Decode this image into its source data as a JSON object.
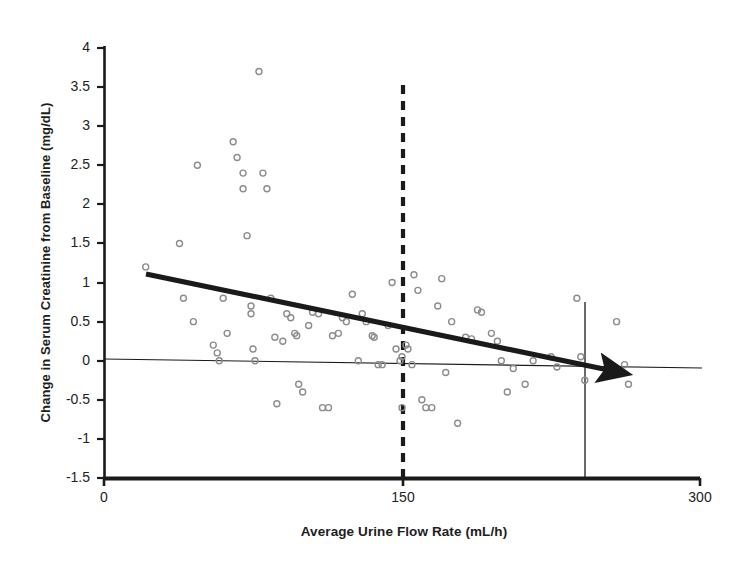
{
  "chart_data": {
    "type": "scatter",
    "title": "",
    "xlabel": "Average Urine Flow Rate (mL/h)",
    "ylabel": "Change in Serum Creatinine from Baseline (mg/dL)",
    "xlim": [
      0,
      300
    ],
    "ylim": [
      -1.5,
      4
    ],
    "xticks": [
      0,
      150,
      300
    ],
    "xtick_labels": [
      "0",
      "150",
      "300"
    ],
    "yticks": [
      -1.5,
      -1,
      -0.5,
      0,
      0.5,
      1,
      1.5,
      2,
      2.5,
      3,
      3.5,
      4
    ],
    "ytick_labels": [
      "-1.5",
      "-1",
      "-0.5",
      "0",
      "0.5",
      "1",
      "1.5",
      "2",
      "2.5",
      "3",
      "3.5",
      "4"
    ],
    "grid": false,
    "legend": "none",
    "marker": {
      "shape": "open-circle",
      "edge_color": "#8c8c8c",
      "fill": "none",
      "size": 6
    },
    "points": [
      {
        "x": 21,
        "y": 1.2
      },
      {
        "x": 38,
        "y": 1.5
      },
      {
        "x": 40,
        "y": 0.8
      },
      {
        "x": 45,
        "y": 0.5
      },
      {
        "x": 47,
        "y": 2.5
      },
      {
        "x": 55,
        "y": 0.2
      },
      {
        "x": 57,
        "y": 0.1
      },
      {
        "x": 58,
        "y": 0.0
      },
      {
        "x": 60,
        "y": 0.8
      },
      {
        "x": 62,
        "y": 0.35
      },
      {
        "x": 65,
        "y": 2.8
      },
      {
        "x": 67,
        "y": 2.6
      },
      {
        "x": 70,
        "y": 2.4
      },
      {
        "x": 70,
        "y": 2.2
      },
      {
        "x": 72,
        "y": 1.6
      },
      {
        "x": 74,
        "y": 0.7
      },
      {
        "x": 74,
        "y": 0.6
      },
      {
        "x": 75,
        "y": 0.15
      },
      {
        "x": 76,
        "y": 0.0
      },
      {
        "x": 78,
        "y": 3.7
      },
      {
        "x": 80,
        "y": 2.4
      },
      {
        "x": 82,
        "y": 2.2
      },
      {
        "x": 84,
        "y": 0.8
      },
      {
        "x": 86,
        "y": 0.3
      },
      {
        "x": 87,
        "y": -0.55
      },
      {
        "x": 90,
        "y": 0.25
      },
      {
        "x": 92,
        "y": 0.6
      },
      {
        "x": 94,
        "y": 0.55
      },
      {
        "x": 96,
        "y": 0.35
      },
      {
        "x": 97,
        "y": 0.32
      },
      {
        "x": 98,
        "y": -0.3
      },
      {
        "x": 100,
        "y": -0.4
      },
      {
        "x": 103,
        "y": 0.45
      },
      {
        "x": 105,
        "y": 0.62
      },
      {
        "x": 108,
        "y": 0.6
      },
      {
        "x": 110,
        "y": -0.6
      },
      {
        "x": 113,
        "y": -0.6
      },
      {
        "x": 115,
        "y": 0.32
      },
      {
        "x": 118,
        "y": 0.35
      },
      {
        "x": 120,
        "y": 0.55
      },
      {
        "x": 122,
        "y": 0.5
      },
      {
        "x": 125,
        "y": 0.85
      },
      {
        "x": 128,
        "y": 0.0
      },
      {
        "x": 130,
        "y": 0.6
      },
      {
        "x": 132,
        "y": 0.5
      },
      {
        "x": 135,
        "y": 0.32
      },
      {
        "x": 136,
        "y": 0.3
      },
      {
        "x": 138,
        "y": -0.05
      },
      {
        "x": 140,
        "y": -0.05
      },
      {
        "x": 143,
        "y": 0.45
      },
      {
        "x": 145,
        "y": 1.0
      },
      {
        "x": 147,
        "y": 0.15
      },
      {
        "x": 149,
        "y": 0.0
      },
      {
        "x": 150,
        "y": 0.05
      },
      {
        "x": 150,
        "y": -0.6
      },
      {
        "x": 152,
        "y": 0.2
      },
      {
        "x": 153,
        "y": 0.15
      },
      {
        "x": 155,
        "y": -0.05
      },
      {
        "x": 156,
        "y": 1.1
      },
      {
        "x": 158,
        "y": 0.9
      },
      {
        "x": 160,
        "y": -0.5
      },
      {
        "x": 162,
        "y": -0.6
      },
      {
        "x": 165,
        "y": -0.6
      },
      {
        "x": 168,
        "y": 0.7
      },
      {
        "x": 170,
        "y": 1.05
      },
      {
        "x": 172,
        "y": -0.15
      },
      {
        "x": 175,
        "y": 0.5
      },
      {
        "x": 178,
        "y": -0.8
      },
      {
        "x": 182,
        "y": 0.3
      },
      {
        "x": 185,
        "y": 0.28
      },
      {
        "x": 188,
        "y": 0.65
      },
      {
        "x": 190,
        "y": 0.62
      },
      {
        "x": 195,
        "y": 0.35
      },
      {
        "x": 198,
        "y": 0.25
      },
      {
        "x": 200,
        "y": 0.0
      },
      {
        "x": 203,
        "y": -0.4
      },
      {
        "x": 206,
        "y": -0.1
      },
      {
        "x": 212,
        "y": -0.3
      },
      {
        "x": 216,
        "y": 0.0
      },
      {
        "x": 225,
        "y": 0.05
      },
      {
        "x": 228,
        "y": -0.08
      },
      {
        "x": 238,
        "y": 0.8
      },
      {
        "x": 240,
        "y": 0.05
      },
      {
        "x": 242,
        "y": -0.25
      },
      {
        "x": 258,
        "y": 0.5
      },
      {
        "x": 262,
        "y": -0.05
      },
      {
        "x": 264,
        "y": -0.3
      }
    ],
    "trend_line": {
      "label": "regression-trend-line",
      "style": "solid-thick-with-arrow",
      "color": "#1a1a1a",
      "x_start": 22,
      "y_start": 1.17,
      "x_end": 263,
      "y_end": -0.12
    },
    "zero_reference_line": {
      "label": "zero-reference-line",
      "style": "thin-solid",
      "color": "#1a1a1a",
      "x_start": 0,
      "y_start": 0.03,
      "x_end": 300,
      "y_end": -0.07
    },
    "threshold_line": {
      "label": "urine-flow-threshold",
      "style": "dashed-vertical",
      "color": "#1a1a1a",
      "x": 150,
      "y_top": 3.4,
      "y_bottom": -1.5
    },
    "marker_line": {
      "label": "upper-flow-marker",
      "style": "thin-vertical",
      "color": "#1a1a1a",
      "x": 242,
      "y_top": 0.75,
      "y_bottom": -1.5
    }
  }
}
